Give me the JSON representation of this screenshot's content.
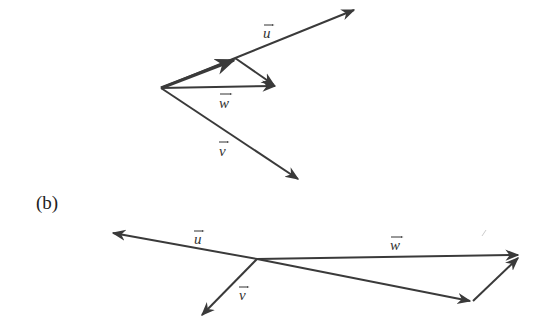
{
  "diagram_a": {
    "labels": {
      "u": "u",
      "w": "w",
      "v": "v"
    }
  },
  "diagram_b": {
    "part_label": "(b)",
    "labels": {
      "u": "u",
      "w": "w",
      "v": "v"
    }
  },
  "colors": {
    "stroke": "#3a3a3a",
    "text": "#333333"
  }
}
